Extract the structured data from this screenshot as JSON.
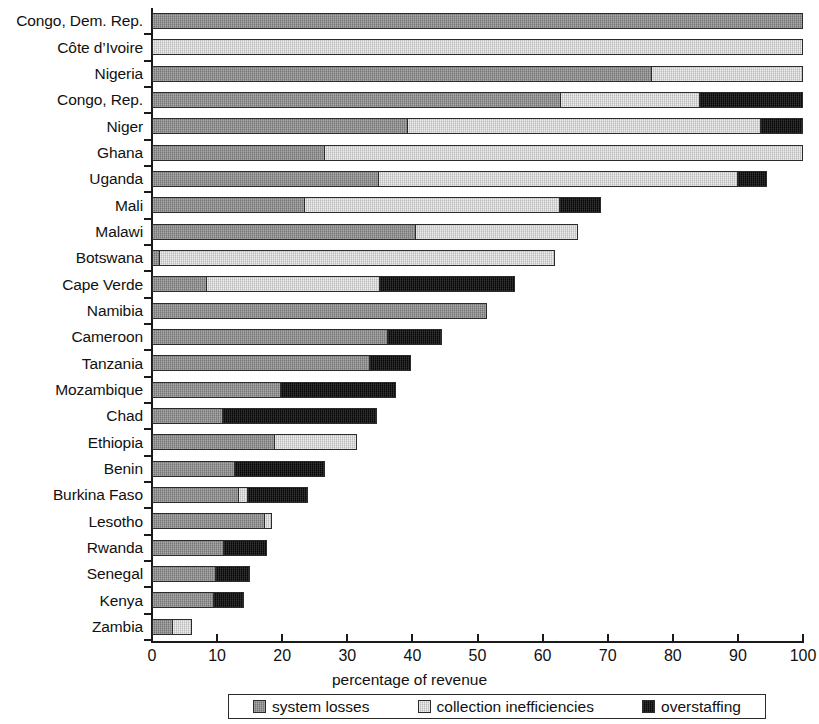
{
  "chart_data": {
    "type": "bar",
    "orientation": "horizontal",
    "stacked": true,
    "title": "",
    "xlabel": "percentage of revenue",
    "ylabel": "",
    "xlim": [
      0,
      100
    ],
    "xticks": [
      0,
      10,
      20,
      30,
      40,
      50,
      60,
      70,
      80,
      90,
      100
    ],
    "grid": false,
    "legend_position": "bottom",
    "series": [
      {
        "name": "system losses",
        "color": "#8f8f8f"
      },
      {
        "name": "collection inefficiencies",
        "color": "#dcdcdc"
      },
      {
        "name": "overstaffing",
        "color": "#0d0d0d"
      }
    ],
    "categories": [
      "Congo, Dem. Rep.",
      "Côte d’Ivoire",
      "Nigeria",
      "Congo, Rep.",
      "Niger",
      "Ghana",
      "Uganda",
      "Mali",
      "Malawi",
      "Botswana",
      "Cape Verde",
      "Namibia",
      "Cameroon",
      "Tanzania",
      "Mozambique",
      "Chad",
      "Ethiopia",
      "Benin",
      "Burkina Faso",
      "Lesotho",
      "Rwanda",
      "Senegal",
      "Kenya",
      "Zambia"
    ],
    "rows": [
      {
        "category": "Congo, Dem. Rep.",
        "system_losses": 100.0,
        "collection_inefficiencies": 0.0,
        "overstaffing": 0.0,
        "total": 100.0
      },
      {
        "category": "Côte d’Ivoire",
        "system_losses": 0.0,
        "collection_inefficiencies": 100.0,
        "overstaffing": 0.0,
        "total": 100.0
      },
      {
        "category": "Nigeria",
        "system_losses": 76.8,
        "collection_inefficiencies": 23.2,
        "overstaffing": 0.0,
        "total": 100.0
      },
      {
        "category": "Congo, Rep.",
        "system_losses": 62.7,
        "collection_inefficiencies": 21.5,
        "overstaffing": 15.8,
        "total": 100.0
      },
      {
        "category": "Niger",
        "system_losses": 39.2,
        "collection_inefficiencies": 54.3,
        "overstaffing": 6.5,
        "total": 100.0
      },
      {
        "category": "Ghana",
        "system_losses": 26.4,
        "collection_inefficiencies": 73.6,
        "overstaffing": 0.0,
        "total": 100.0
      },
      {
        "category": "Uganda",
        "system_losses": 34.7,
        "collection_inefficiencies": 55.3,
        "overstaffing": 4.5,
        "total": 94.5
      },
      {
        "category": "Mali",
        "system_losses": 23.3,
        "collection_inefficiencies": 39.4,
        "overstaffing": 6.3,
        "total": 69.0
      },
      {
        "category": "Malawi",
        "system_losses": 40.4,
        "collection_inefficiencies": 25.1,
        "overstaffing": 0.0,
        "total": 65.5
      },
      {
        "category": "Botswana",
        "system_losses": 1.0,
        "collection_inefficiencies": 60.9,
        "overstaffing": 0.0,
        "total": 61.9
      },
      {
        "category": "Cape Verde",
        "system_losses": 8.2,
        "collection_inefficiencies": 26.7,
        "overstaffing": 20.9,
        "total": 55.8
      },
      {
        "category": "Namibia",
        "system_losses": 51.4,
        "collection_inefficiencies": 0.0,
        "overstaffing": 0.0,
        "total": 51.4
      },
      {
        "category": "Cameroon",
        "system_losses": 36.2,
        "collection_inefficiencies": 0.0,
        "overstaffing": 8.3,
        "total": 44.5
      },
      {
        "category": "Tanzania",
        "system_losses": 33.4,
        "collection_inefficiencies": 0.0,
        "overstaffing": 6.4,
        "total": 39.8
      },
      {
        "category": "Mozambique",
        "system_losses": 19.7,
        "collection_inefficiencies": 0.0,
        "overstaffing": 17.8,
        "total": 37.5
      },
      {
        "category": "Chad",
        "system_losses": 10.7,
        "collection_inefficiencies": 0.0,
        "overstaffing": 23.8,
        "total": 34.5
      },
      {
        "category": "Ethiopia",
        "system_losses": 18.7,
        "collection_inefficiencies": 12.8,
        "overstaffing": 0.0,
        "total": 31.5
      },
      {
        "category": "Benin",
        "system_losses": 12.6,
        "collection_inefficiencies": 0.0,
        "overstaffing": 14.0,
        "total": 26.6
      },
      {
        "category": "Burkina Faso",
        "system_losses": 13.2,
        "collection_inefficiencies": 1.4,
        "overstaffing": 9.4,
        "total": 24.0
      },
      {
        "category": "Lesotho",
        "system_losses": 17.4,
        "collection_inefficiencies": 1.1,
        "overstaffing": 0.0,
        "total": 18.5
      },
      {
        "category": "Rwanda",
        "system_losses": 10.9,
        "collection_inefficiencies": 0.0,
        "overstaffing": 6.8,
        "total": 17.7
      },
      {
        "category": "Senegal",
        "system_losses": 9.7,
        "collection_inefficiencies": 0.0,
        "overstaffing": 5.4,
        "total": 15.1
      },
      {
        "category": "Kenya",
        "system_losses": 9.4,
        "collection_inefficiencies": 0.0,
        "overstaffing": 4.8,
        "total": 14.2
      },
      {
        "category": "Zambia",
        "system_losses": 3.0,
        "collection_inefficiencies": 3.2,
        "overstaffing": 0.0,
        "total": 6.2
      }
    ]
  },
  "axis": {
    "x_title": "percentage of revenue",
    "x_ticks": [
      "0",
      "10",
      "20",
      "30",
      "40",
      "50",
      "60",
      "70",
      "80",
      "90",
      "100"
    ]
  },
  "legend": {
    "items": [
      {
        "label": "system losses",
        "key": "system_losses"
      },
      {
        "label": "collection inefficiencies",
        "key": "collection_inefficiencies"
      },
      {
        "label": "overstaffing",
        "key": "overstaffing"
      }
    ]
  }
}
